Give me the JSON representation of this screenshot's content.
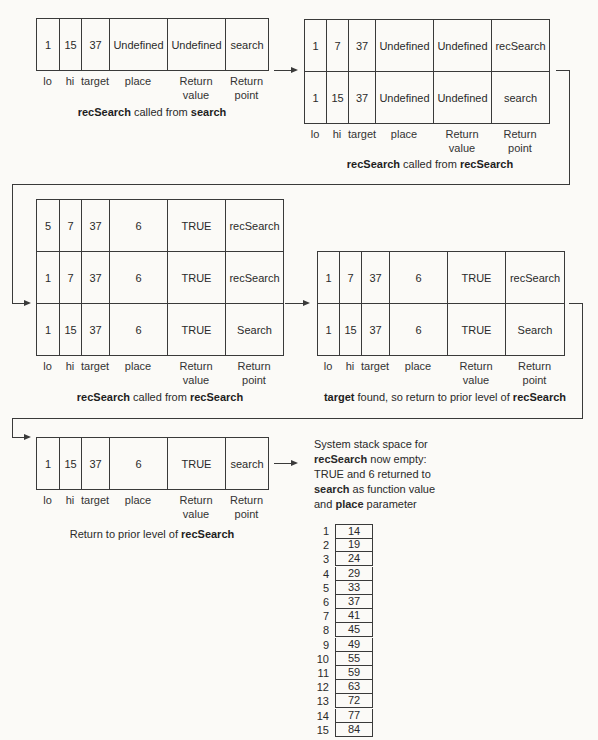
{
  "columns": {
    "lo": "lo",
    "hi": "hi",
    "target": "target",
    "place": "place",
    "return_value": "Return value",
    "return_value_l1": "Return",
    "return_value_l2": "value",
    "return_point_l1": "Return",
    "return_point_l2": "point"
  },
  "frames": [
    {
      "id": "frame-1",
      "rows": [
        {
          "lo": "1",
          "hi": "15",
          "target": "37",
          "place": "Undefined",
          "return_value": "Undefined",
          "return_point": "search"
        }
      ],
      "caption": {
        "b1": "recSearch",
        "t1": " called from ",
        "b2": "search",
        "t2": "",
        "b3": ""
      }
    },
    {
      "id": "frame-2",
      "rows": [
        {
          "lo": "1",
          "hi": "7",
          "target": "37",
          "place": "Undefined",
          "return_value": "Undefined",
          "return_point": "recSearch"
        },
        {
          "lo": "1",
          "hi": "15",
          "target": "37",
          "place": "Undefined",
          "return_value": "Undefined",
          "return_point": "search"
        }
      ],
      "caption": {
        "b1": "recSearch",
        "t1": " called from ",
        "b2": "recSearch"
      }
    },
    {
      "id": "frame-3",
      "rows": [
        {
          "lo": "5",
          "hi": "7",
          "target": "37",
          "place": "6",
          "return_value": "TRUE",
          "return_point": "recSearch"
        },
        {
          "lo": "1",
          "hi": "7",
          "target": "37",
          "place": "6",
          "return_value": "TRUE",
          "return_point": "recSearch"
        },
        {
          "lo": "1",
          "hi": "15",
          "target": "37",
          "place": "6",
          "return_value": "TRUE",
          "return_point": "Search"
        }
      ],
      "caption": {
        "b1": "recSearch",
        "t1": " called from ",
        "b2": "recSearch"
      }
    },
    {
      "id": "frame-4",
      "rows": [
        {
          "lo": "1",
          "hi": "7",
          "target": "37",
          "place": "6",
          "return_value": "TRUE",
          "return_point": "recSearch"
        },
        {
          "lo": "1",
          "hi": "15",
          "target": "37",
          "place": "6",
          "return_value": "TRUE",
          "return_point": "Search"
        }
      ],
      "caption": {
        "b1": "target",
        "t1": " found, so return to prior level of ",
        "b2": "recSearch"
      }
    },
    {
      "id": "frame-5",
      "rows": [
        {
          "lo": "1",
          "hi": "15",
          "target": "37",
          "place": "6",
          "return_value": "TRUE",
          "return_point": "search"
        }
      ],
      "caption": {
        "t0": "Return to prior level of ",
        "b2": "recSearch"
      }
    }
  ],
  "note": {
    "l1": "System stack space for",
    "l2_b": "recSearch",
    "l2_t": " now empty:",
    "l3": "TRUE and 6 returned to",
    "l4_b": "search",
    "l4_t": " as function value",
    "l5_t": "and ",
    "l5_b": "place",
    "l5_t2": " parameter"
  },
  "array": {
    "indices": [
      "1",
      "2",
      "3",
      "4",
      "5",
      "6",
      "7",
      "8",
      "9",
      "10",
      "11",
      "12",
      "13",
      "14",
      "15"
    ],
    "values": [
      "14",
      "19",
      "24",
      "29",
      "33",
      "37",
      "41",
      "45",
      "49",
      "55",
      "59",
      "63",
      "72",
      "77",
      "84"
    ]
  }
}
